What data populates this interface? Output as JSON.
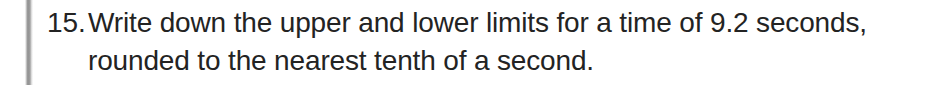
{
  "page": {
    "background_color": "#ffffff",
    "text_color": "#232323",
    "margin_rule_color": "#8a8a8a"
  },
  "question": {
    "number_label": "15.",
    "full_text": "Write down the upper and lower limits for a time of 9.2 seconds, rounded to the nearest tenth of a second.",
    "lines": [
      "Write down the upper and lower limits for a time of 9.2 seconds,",
      "rounded to the nearest tenth of a second."
    ],
    "value_mentioned": "9.2 seconds",
    "rounding_precision": "nearest tenth of a second"
  }
}
